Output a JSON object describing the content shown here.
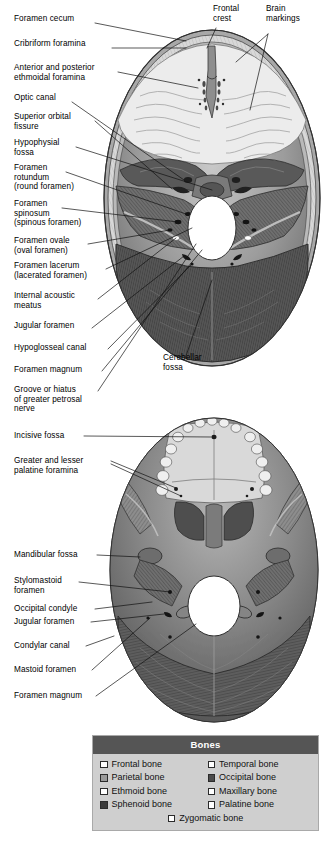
{
  "figure": {
    "background_color": "#ffffff"
  },
  "labels": {
    "top_panel": [
      {
        "id": "foramen-cecum",
        "text": "Foramen cecum",
        "x": 14,
        "y": 19,
        "line": [
          [
            95,
            23
          ],
          [
            186,
            41
          ]
        ]
      },
      {
        "id": "cribriform-foramina",
        "text": "Cribriform foramina",
        "x": 14,
        "y": 44,
        "line": [
          [
            112,
            48
          ],
          [
            186,
            48
          ]
        ]
      },
      {
        "id": "ethmoidal-foramina",
        "text": "Anterior and posterior\nethmoidal foramina",
        "x": 14,
        "y": 68,
        "line": [
          [
            118,
            72
          ],
          [
            198,
            88
          ]
        ]
      },
      {
        "id": "optic-canal",
        "text": "Optic canal",
        "x": 14,
        "y": 98,
        "line": [
          [
            72,
            102
          ],
          [
            122,
            113
          ]
        ]
      },
      {
        "id": "superior-orbital-fissure",
        "text": "Superior orbital\nfissure",
        "x": 14,
        "y": 117,
        "line": [
          [
            95,
            121
          ],
          [
            122,
            127
          ]
        ]
      },
      {
        "id": "hypophysial-fossa",
        "text": "Hypophysial\nfossa",
        "x": 14,
        "y": 143,
        "line": [
          [
            76,
            147
          ],
          [
            216,
            153
          ]
        ]
      },
      {
        "id": "foramen-rotundum",
        "text": "Foramen\nrotundum\n(round foramen)",
        "x": 14,
        "y": 168,
        "line": [
          [
            66,
            172
          ],
          [
            153,
            200
          ]
        ]
      },
      {
        "id": "foramen-spinosum",
        "text": "Foramen\nspinosum\n(spinous foramen)",
        "x": 14,
        "y": 204,
        "line": [
          [
            62,
            208
          ],
          [
            160,
            216
          ]
        ]
      },
      {
        "id": "foramen-ovale",
        "text": "Foramen ovale\n(oval foramen)",
        "x": 14,
        "y": 240,
        "line": [
          [
            88,
            244
          ],
          [
            172,
            214
          ]
        ]
      },
      {
        "id": "foramen-lacerum",
        "text": "Foramen lacerum\n(lacerated foramen)",
        "x": 14,
        "y": 265,
        "line": [
          [
            106,
            292
          ],
          [
            166,
            226
          ]
        ]
      },
      {
        "id": "internal-acoustic-meatus",
        "text": "Internal acoustic\nmeatus",
        "x": 14,
        "y": 295,
        "line": [
          [
            98,
            299
          ],
          [
            186,
            234
          ]
        ]
      },
      {
        "id": "jugular-foramen",
        "text": "Jugular foramen",
        "x": 14,
        "y": 325,
        "line": [
          [
            92,
            328
          ],
          [
            190,
            250
          ]
        ]
      },
      {
        "id": "hypoglosseal-canal",
        "text": "Hypoglosseal canal",
        "x": 14,
        "y": 346,
        "line": [
          [
            108,
            349
          ],
          [
            194,
            262
          ]
        ]
      },
      {
        "id": "foramen-magnum",
        "text": "Foramen magnum",
        "x": 14,
        "y": 368,
        "line": [
          [
            102,
            371
          ],
          [
            196,
            222
          ]
        ]
      },
      {
        "id": "groove-greater-petrosal-nerve",
        "text": "Groove or hiatus\nof greater petrosal\nnerve",
        "x": 14,
        "y": 388,
        "line": [
          [
            98,
            391
          ],
          [
            190,
            244
          ]
        ]
      },
      {
        "id": "frontal-crest",
        "text": "Frontal\ncrest",
        "x": 213,
        "y": 6,
        "line": [
          [
            214,
            26
          ],
          [
            196,
            41
          ]
        ]
      },
      {
        "id": "brain-markings",
        "text": "Brain\nmarkings",
        "x": 266,
        "y": 6,
        "line": [
          [
            266,
            33
          ],
          [
            220,
            60
          ]
        ]
      },
      {
        "id": "cerebellar-fossa",
        "text": "Cerebellar\nfossa",
        "x": 163,
        "y": 358,
        "line": [
          [
            186,
            357
          ],
          [
            208,
            278
          ]
        ]
      }
    ],
    "bottom_panel": [
      {
        "id": "incisive-fossa",
        "text": "Incisive fossa",
        "x": 14,
        "y": 432,
        "line": [
          [
            84,
            436
          ],
          [
            195,
            437
          ]
        ]
      },
      {
        "id": "palatine-foramina",
        "text": "Greater and lesser\npalatine foramina",
        "x": 14,
        "y": 457,
        "line": [
          [
            111,
            461
          ],
          [
            176,
            486
          ]
        ]
      },
      {
        "id": "mandibular-fossa",
        "text": "Mandibular fossa",
        "x": 14,
        "y": 552,
        "line": [
          [
            97,
            555
          ],
          [
            128,
            562
          ]
        ]
      },
      {
        "id": "stylomastoid-foramen",
        "text": "Stylomastoid\nforamen",
        "x": 14,
        "y": 578,
        "line": [
          [
            79,
            581
          ],
          [
            168,
            592
          ]
        ]
      },
      {
        "id": "occipital-condyle",
        "text": "Occipital condyle",
        "x": 14,
        "y": 608,
        "line": [
          [
            95,
            609
          ],
          [
            166,
            611
          ]
        ]
      },
      {
        "id": "jugular-foramen-2",
        "text": "Jugular foramen",
        "x": 14,
        "y": 620,
        "line": [
          [
            91,
            622
          ],
          [
            163,
            616
          ]
        ]
      },
      {
        "id": "condylar-canal",
        "text": "Condylar canal",
        "x": 14,
        "y": 644,
        "line": [
          [
            86,
            646
          ],
          [
            112,
            637
          ]
        ]
      },
      {
        "id": "mastoid-foramen",
        "text": "Mastoid foramen",
        "x": 14,
        "y": 668,
        "line": [
          [
            92,
            670
          ],
          [
            148,
            618
          ]
        ]
      },
      {
        "id": "foramen-magnum-2",
        "text": "Foramen magnum",
        "x": 14,
        "y": 694,
        "line": [
          [
            96,
            696
          ],
          [
            186,
            618
          ]
        ]
      }
    ]
  },
  "legend": {
    "title": "Bones",
    "items": [
      {
        "label": "Frontal bone",
        "color": "#ffffff"
      },
      {
        "label": "Temporal bone",
        "color": "#ffffff"
      },
      {
        "label": "Parietal bone",
        "color": "#9a9a9a"
      },
      {
        "label": "Occipital bone",
        "color": "#4a4a4a"
      },
      {
        "label": "Ethmoid bone",
        "color": "#ffffff"
      },
      {
        "label": "Maxillary bone",
        "color": "#ffffff"
      },
      {
        "label": "Sphenoid bone",
        "color": "#3a3a3a"
      },
      {
        "label": "Palatine bone",
        "color": "#ffffff"
      },
      {
        "label": "Zygomatic bone",
        "color": "#ffffff"
      }
    ],
    "header_color": "#555555",
    "body_color": "#cfcfcf",
    "border_color": "#a9a9a9"
  }
}
